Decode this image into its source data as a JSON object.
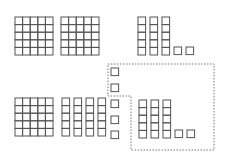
{
  "diagram": {
    "type": "base-ten-blocks",
    "colors": {
      "stroke": "#555555",
      "dashed_outline": "#777777",
      "background": "#ffffff"
    },
    "cell_size": 7.6,
    "top_row": {
      "hundreds": [
        {
          "x": 15,
          "y": 17
        },
        {
          "x": 61,
          "y": 17
        }
      ],
      "tens": [
        {
          "x": 138,
          "y": 17
        },
        {
          "x": 150,
          "y": 17
        },
        {
          "x": 162,
          "y": 17
        }
      ],
      "ones": [
        {
          "x": 174,
          "y": 47
        },
        {
          "x": 186,
          "y": 47
        }
      ]
    },
    "bottom_row": {
      "hundreds": [
        {
          "x": 15,
          "y": 98
        }
      ],
      "tens": [
        {
          "x": 62,
          "y": 98
        },
        {
          "x": 74,
          "y": 98
        },
        {
          "x": 86,
          "y": 98
        },
        {
          "x": 98,
          "y": 98
        }
      ],
      "ones_column": [
        {
          "x": 111,
          "y": 68
        },
        {
          "x": 111,
          "y": 84
        },
        {
          "x": 111,
          "y": 100
        },
        {
          "x": 111,
          "y": 116
        },
        {
          "x": 111,
          "y": 131
        }
      ],
      "group_tens": [
        {
          "x": 139,
          "y": 100
        },
        {
          "x": 151,
          "y": 100
        },
        {
          "x": 163,
          "y": 100
        }
      ],
      "group_ones": [
        {
          "x": 175,
          "y": 130
        },
        {
          "x": 187,
          "y": 130
        }
      ]
    },
    "dashed_region": "108,64 214,64 214,150 131,150 131,96 108,96"
  }
}
